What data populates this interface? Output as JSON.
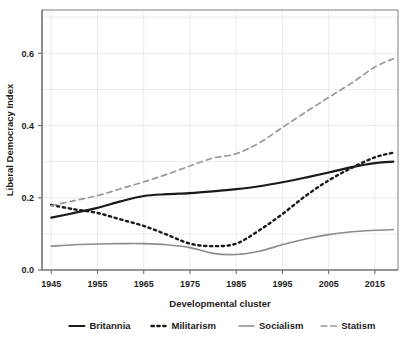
{
  "chart_data": {
    "type": "line",
    "title": "",
    "xlabel": "Developmental cluster",
    "ylabel": "Liberal Democracy Index",
    "xlim": [
      1943,
      2020
    ],
    "ylim": [
      0.0,
      0.72
    ],
    "xticks": [
      1945,
      1955,
      1965,
      1975,
      1985,
      1995,
      2005,
      2015
    ],
    "xtick_labels": [
      "1945",
      "1955",
      "1965",
      "1975",
      "1985",
      "1995",
      "2005",
      "2015"
    ],
    "yticks": [
      0.0,
      0.2,
      0.4,
      0.6
    ],
    "ytick_labels": [
      "0.0",
      "0.2",
      "0.4",
      "0.6"
    ],
    "grid": true,
    "legend_position": "below-axis",
    "x": [
      1945,
      1950,
      1955,
      1960,
      1965,
      1970,
      1975,
      1980,
      1985,
      1990,
      1995,
      2000,
      2005,
      2010,
      2015,
      2019
    ],
    "series": [
      {
        "name": "Britannia",
        "style": "solid",
        "color": "#1a1a1a",
        "width": 2.2,
        "values": [
          0.145,
          0.158,
          0.172,
          0.19,
          0.205,
          0.21,
          0.213,
          0.218,
          0.224,
          0.232,
          0.243,
          0.256,
          0.27,
          0.285,
          0.296,
          0.3
        ]
      },
      {
        "name": "Militarism",
        "style": "dotted",
        "color": "#1a1a1a",
        "width": 2.4,
        "values": [
          0.18,
          0.168,
          0.158,
          0.14,
          0.122,
          0.098,
          0.073,
          0.066,
          0.073,
          0.11,
          0.155,
          0.205,
          0.248,
          0.283,
          0.312,
          0.325
        ]
      },
      {
        "name": "Socialism",
        "style": "solid",
        "color": "#8c8c8c",
        "width": 1.6,
        "values": [
          0.066,
          0.07,
          0.072,
          0.073,
          0.073,
          0.07,
          0.062,
          0.046,
          0.043,
          0.052,
          0.07,
          0.086,
          0.098,
          0.106,
          0.11,
          0.112
        ]
      },
      {
        "name": "Statism",
        "style": "dashed",
        "color": "#9a9a9a",
        "width": 1.7,
        "values": [
          0.178,
          0.192,
          0.206,
          0.225,
          0.244,
          0.265,
          0.288,
          0.31,
          0.322,
          0.352,
          0.395,
          0.437,
          0.478,
          0.518,
          0.562,
          0.585
        ]
      }
    ]
  },
  "legend": {
    "items": [
      {
        "label": "Britannia",
        "style": "solid",
        "color": "#1a1a1a"
      },
      {
        "label": "Militarism",
        "style": "dotted",
        "color": "#1a1a1a"
      },
      {
        "label": "Socialism",
        "style": "solid",
        "color": "#8c8c8c"
      },
      {
        "label": "Statism",
        "style": "dashed",
        "color": "#9a9a9a"
      }
    ]
  }
}
